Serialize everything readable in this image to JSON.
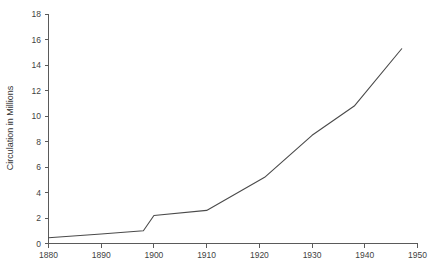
{
  "chart_data": {
    "type": "line",
    "title": "",
    "xlabel": "",
    "ylabel": "Circulation in Millions",
    "xlim": [
      1880,
      1950
    ],
    "ylim": [
      0,
      18
    ],
    "xticks": [
      1880,
      1890,
      1900,
      1910,
      1920,
      1930,
      1940,
      1950
    ],
    "yticks": [
      0,
      2,
      4,
      6,
      8,
      10,
      12,
      14,
      16,
      18
    ],
    "xtick_labels": [
      "1880",
      "1890",
      "1900",
      "1910",
      "1920",
      "1930",
      "1940",
      "1950"
    ],
    "ytick_labels": [
      "0",
      "2",
      "4",
      "6",
      "8",
      "10",
      "12",
      "14",
      "16",
      "18"
    ],
    "grid": false,
    "legend": false,
    "legend_position": "none",
    "series": [
      {
        "name": "Circulation",
        "x": [
          1880,
          1890,
          1898,
          1900,
          1910,
          1921,
          1930,
          1938,
          1947
        ],
        "values": [
          0.45,
          0.75,
          1.0,
          2.2,
          2.6,
          5.2,
          8.5,
          10.8,
          15.3
        ]
      }
    ],
    "colors": {
      "line": "#4a4a4a",
      "axis": "#5a5a5a",
      "text": "#3f3f3f",
      "background": "#ffffff"
    }
  }
}
